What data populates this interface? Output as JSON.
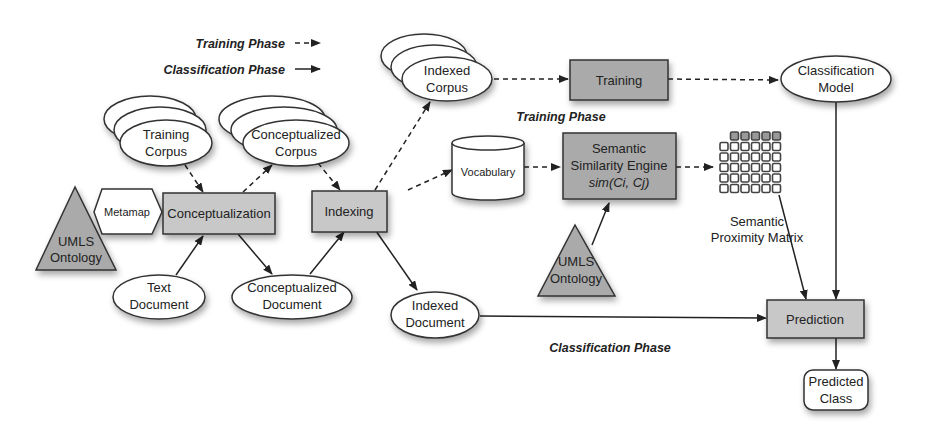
{
  "legend": {
    "training_phase": "Training Phase",
    "classification_phase": "Classification Phase"
  },
  "nodes": {
    "training_corpus": [
      "Training",
      "Corpus"
    ],
    "conceptualized_corpus": [
      "Conceptualized",
      "Corpus"
    ],
    "indexed_corpus": [
      "Indexed",
      "Corpus"
    ],
    "metamap": "Metamap",
    "umls_left": [
      "UMLS",
      "Ontology"
    ],
    "conceptualization": "Conceptualization",
    "indexing": "Indexing",
    "text_document": [
      "Text",
      "Document"
    ],
    "conceptualized_document": [
      "Conceptualized",
      "Document"
    ],
    "indexed_document": [
      "Indexed",
      "Document"
    ],
    "vocabulary": "Vocabulary",
    "training": "Training",
    "sse": [
      "Semantic",
      "Similarity Engine",
      "sim(Ci, Cj)"
    ],
    "umls_right": [
      "UMLS",
      "Ontology"
    ],
    "matrix_label": [
      "Semantic",
      "Proximity Matrix"
    ],
    "classification_model": [
      "Classification",
      "Model"
    ],
    "prediction": "Prediction",
    "predicted_class": [
      "Predicted",
      "Class"
    ]
  },
  "annotations": {
    "training_phase_label": "Training Phase",
    "classification_phase_label": "Classification Phase"
  }
}
